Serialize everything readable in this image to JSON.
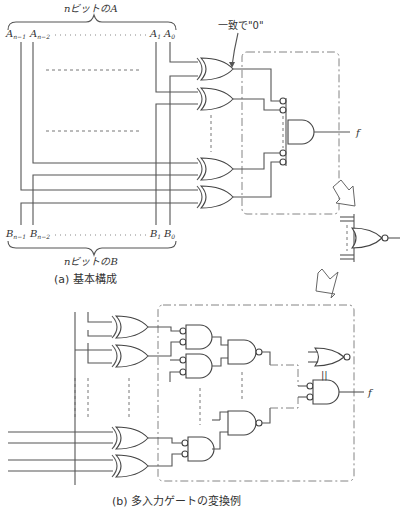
{
  "figure_a": {
    "top_brace_label": "nビットのA",
    "bottom_brace_label": "nビットのB",
    "a_inputs": [
      "A",
      "A",
      "A",
      "A"
    ],
    "a_subscripts": [
      "n−1",
      "n−2",
      "1",
      "0"
    ],
    "b_inputs": [
      "B",
      "B",
      "B",
      "B"
    ],
    "b_subscripts": [
      "n−1",
      "n−2",
      "1",
      "0"
    ],
    "annotation": "一致で\"0\"",
    "output_label": "f",
    "caption": "(a) 基本構成"
  },
  "figure_b": {
    "equivalence_mark": "||",
    "output_label": "f",
    "caption": "(b) 多入力ゲートの変換例"
  }
}
